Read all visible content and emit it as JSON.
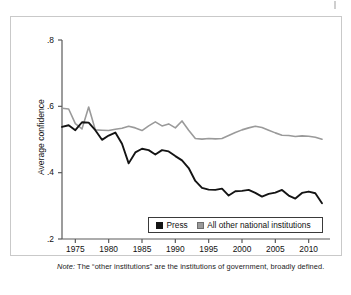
{
  "figure": {
    "note_lead": "Note:",
    "note_text": " The “other institutions” are the institutions of government, broadly defined."
  },
  "chart_data": {
    "type": "line",
    "title": "",
    "xlabel": "",
    "ylabel": "Average confidence",
    "xlim": [
      1973,
      2012
    ],
    "ylim": [
      0.2,
      0.8
    ],
    "yticks": [
      0.2,
      0.4,
      0.6,
      0.8
    ],
    "ytick_labels": [
      ".2",
      ".4",
      ".6",
      ".8"
    ],
    "xticks": [
      1975,
      1980,
      1985,
      1990,
      1995,
      2000,
      2005,
      2010
    ],
    "xtick_labels": [
      "1975",
      "1980",
      "1985",
      "1990",
      "1995",
      "2000",
      "2005",
      "2010"
    ],
    "grid": false,
    "legend_position": "lower-center",
    "colors": {
      "press": "#141414",
      "other": "#9a9a9a"
    },
    "x": [
      1973,
      1974,
      1975,
      1976,
      1977,
      1978,
      1979,
      1980,
      1981,
      1982,
      1983,
      1984,
      1985,
      1986,
      1987,
      1988,
      1989,
      1990,
      1991,
      1992,
      1993,
      1994,
      1995,
      1996,
      1997,
      1998,
      1999,
      2000,
      2001,
      2002,
      2003,
      2004,
      2005,
      2006,
      2007,
      2008,
      2009,
      2010,
      2011,
      2012
    ],
    "series": [
      {
        "name": "Press",
        "color": "#141414",
        "values": [
          0.538,
          0.543,
          0.528,
          0.552,
          0.551,
          0.528,
          0.499,
          0.512,
          0.521,
          0.487,
          0.428,
          0.461,
          0.472,
          0.468,
          0.455,
          0.468,
          0.464,
          0.45,
          0.437,
          0.414,
          0.375,
          0.354,
          0.349,
          0.348,
          0.352,
          0.331,
          0.344,
          0.345,
          0.348,
          0.339,
          0.328,
          0.336,
          0.34,
          0.348,
          0.331,
          0.322,
          0.339,
          0.343,
          0.338,
          0.308
        ]
      },
      {
        "name": "All other national institutions",
        "color": "#9a9a9a",
        "values": [
          0.594,
          0.592,
          0.548,
          0.532,
          0.598,
          0.529,
          0.528,
          0.527,
          0.531,
          0.534,
          0.54,
          0.535,
          0.527,
          0.541,
          0.553,
          0.541,
          0.547,
          0.535,
          0.556,
          0.528,
          0.503,
          0.501,
          0.503,
          0.502,
          0.503,
          0.512,
          0.521,
          0.529,
          0.535,
          0.54,
          0.536,
          0.528,
          0.52,
          0.513,
          0.512,
          0.509,
          0.511,
          0.51,
          0.507,
          0.501
        ]
      }
    ],
    "legend": [
      {
        "label": "Press",
        "color": "#141414"
      },
      {
        "label": "All other national institutions",
        "color": "#9a9a9a"
      }
    ]
  }
}
